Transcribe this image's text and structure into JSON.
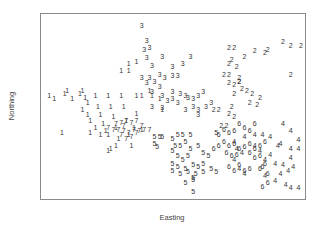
{
  "chart_data": {
    "type": "scatter",
    "title": "",
    "xlabel": "Easting",
    "ylabel": "Northing",
    "grid": false,
    "legend": null,
    "axes_ticks_shown": false,
    "marker": "cluster-number-text",
    "plot_frame_px": {
      "x0": 40,
      "y0": 13,
      "x1": 305,
      "y1": 199
    },
    "series": [
      {
        "name": "1",
        "points": [
          [
            0.02,
            0.44
          ],
          [
            0.04,
            0.46
          ],
          [
            0.08,
            0.43
          ],
          [
            0.09,
            0.41
          ],
          [
            0.11,
            0.46
          ],
          [
            0.14,
            0.43
          ],
          [
            0.15,
            0.41
          ],
          [
            0.16,
            0.45
          ],
          [
            0.17,
            0.48
          ],
          [
            0.15,
            0.52
          ],
          [
            0.17,
            0.55
          ],
          [
            0.18,
            0.58
          ],
          [
            0.2,
            0.44
          ],
          [
            0.21,
            0.5
          ],
          [
            0.22,
            0.55
          ],
          [
            0.23,
            0.6
          ],
          [
            0.24,
            0.64
          ],
          [
            0.25,
            0.44
          ],
          [
            0.26,
            0.5
          ],
          [
            0.27,
            0.56
          ],
          [
            0.28,
            0.62
          ],
          [
            0.29,
            0.68
          ],
          [
            0.3,
            0.44
          ],
          [
            0.31,
            0.5
          ],
          [
            0.32,
            0.58
          ],
          [
            0.33,
            0.66
          ],
          [
            0.34,
            0.72
          ],
          [
            0.36,
            0.44
          ],
          [
            0.38,
            0.44
          ],
          [
            0.41,
            0.41
          ],
          [
            0.42,
            0.44
          ],
          [
            0.45,
            0.46
          ],
          [
            0.46,
            0.52
          ],
          [
            0.36,
            0.54
          ],
          [
            0.35,
            0.62
          ],
          [
            0.38,
            0.63
          ],
          [
            0.2,
            0.62
          ],
          [
            0.22,
            0.66
          ],
          [
            0.25,
            0.66
          ],
          [
            0.28,
            0.72
          ],
          [
            0.3,
            0.3
          ],
          [
            0.33,
            0.3
          ],
          [
            0.36,
            0.25
          ],
          [
            0.33,
            0.26
          ],
          [
            0.07,
            0.65
          ],
          [
            0.18,
            0.65
          ],
          [
            0.25,
            0.75
          ],
          [
            0.26,
            0.74
          ]
        ]
      },
      {
        "name": "2",
        "points": [
          [
            0.72,
            0.17
          ],
          [
            0.74,
            0.17
          ],
          [
            0.78,
            0.22
          ],
          [
            0.82,
            0.19
          ],
          [
            0.86,
            0.2
          ],
          [
            0.87,
            0.18
          ],
          [
            0.93,
            0.14
          ],
          [
            0.96,
            0.16
          ],
          [
            1.0,
            0.16
          ],
          [
            0.72,
            0.26
          ],
          [
            0.73,
            0.24
          ],
          [
            0.75,
            0.28
          ],
          [
            0.7,
            0.32
          ],
          [
            0.72,
            0.32
          ],
          [
            0.76,
            0.34
          ],
          [
            0.72,
            0.37
          ],
          [
            0.74,
            0.38
          ],
          [
            0.76,
            0.36
          ],
          [
            0.77,
            0.4
          ],
          [
            0.79,
            0.41
          ],
          [
            0.81,
            0.43
          ],
          [
            0.74,
            0.43
          ],
          [
            0.8,
            0.48
          ],
          [
            0.84,
            0.45
          ],
          [
            0.83,
            0.49
          ],
          [
            0.73,
            0.5
          ],
          [
            0.72,
            0.54
          ],
          [
            0.74,
            0.56
          ],
          [
            0.96,
            0.32
          ],
          [
            0.66,
            0.52
          ],
          [
            0.68,
            0.52
          ],
          [
            0.69,
            0.61
          ],
          [
            0.71,
            0.61
          ],
          [
            0.76,
            0.36
          ]
        ]
      },
      {
        "name": "3",
        "points": [
          [
            0.38,
            0.05
          ],
          [
            0.4,
            0.13
          ],
          [
            0.41,
            0.17
          ],
          [
            0.39,
            0.18
          ],
          [
            0.4,
            0.23
          ],
          [
            0.42,
            0.27
          ],
          [
            0.46,
            0.22
          ],
          [
            0.5,
            0.28
          ],
          [
            0.54,
            0.26
          ],
          [
            0.57,
            0.22
          ],
          [
            0.38,
            0.34
          ],
          [
            0.41,
            0.34
          ],
          [
            0.43,
            0.36
          ],
          [
            0.45,
            0.32
          ],
          [
            0.47,
            0.34
          ],
          [
            0.5,
            0.33
          ],
          [
            0.52,
            0.33
          ],
          [
            0.4,
            0.37
          ],
          [
            0.45,
            0.39
          ],
          [
            0.42,
            0.42
          ],
          [
            0.46,
            0.44
          ],
          [
            0.5,
            0.42
          ],
          [
            0.53,
            0.43
          ],
          [
            0.55,
            0.44
          ],
          [
            0.5,
            0.46
          ],
          [
            0.48,
            0.47
          ],
          [
            0.42,
            0.5
          ],
          [
            0.46,
            0.51
          ],
          [
            0.52,
            0.48
          ],
          [
            0.56,
            0.45
          ],
          [
            0.6,
            0.44
          ],
          [
            0.62,
            0.42
          ],
          [
            0.58,
            0.46
          ],
          [
            0.55,
            0.52
          ],
          [
            0.6,
            0.52
          ],
          [
            0.63,
            0.5
          ],
          [
            0.65,
            0.48
          ],
          [
            0.6,
            0.55
          ],
          [
            0.58,
            0.5
          ]
        ]
      },
      {
        "name": "4",
        "points": [
          [
            0.74,
            0.7
          ],
          [
            0.78,
            0.67
          ],
          [
            0.82,
            0.66
          ],
          [
            0.85,
            0.66
          ],
          [
            0.88,
            0.67
          ],
          [
            0.93,
            0.6
          ],
          [
            0.96,
            0.64
          ],
          [
            0.99,
            0.69
          ],
          [
            0.92,
            0.71
          ],
          [
            0.96,
            0.74
          ],
          [
            0.99,
            0.74
          ],
          [
            0.82,
            0.72
          ],
          [
            0.84,
            0.75
          ],
          [
            0.88,
            0.77
          ],
          [
            0.86,
            0.8
          ],
          [
            0.9,
            0.82
          ],
          [
            0.93,
            0.83
          ],
          [
            0.96,
            0.79
          ],
          [
            0.97,
            0.84
          ],
          [
            0.92,
            0.88
          ],
          [
            0.95,
            0.86
          ],
          [
            0.9,
            0.92
          ],
          [
            0.94,
            0.94
          ],
          [
            0.96,
            0.96
          ],
          [
            0.99,
            0.96
          ],
          [
            0.86,
            0.89
          ],
          [
            0.91,
            0.72
          ],
          [
            0.75,
            0.74
          ],
          [
            0.77,
            0.76
          ],
          [
            0.74,
            0.8
          ],
          [
            0.76,
            0.85
          ],
          [
            0.78,
            0.88
          ]
        ]
      },
      {
        "name": "5",
        "points": [
          [
            0.5,
            0.68
          ],
          [
            0.52,
            0.66
          ],
          [
            0.54,
            0.66
          ],
          [
            0.51,
            0.72
          ],
          [
            0.53,
            0.72
          ],
          [
            0.55,
            0.7
          ],
          [
            0.5,
            0.75
          ],
          [
            0.52,
            0.78
          ],
          [
            0.54,
            0.8
          ],
          [
            0.56,
            0.78
          ],
          [
            0.5,
            0.82
          ],
          [
            0.52,
            0.84
          ],
          [
            0.55,
            0.85
          ],
          [
            0.58,
            0.83
          ],
          [
            0.6,
            0.84
          ],
          [
            0.62,
            0.82
          ],
          [
            0.57,
            0.74
          ],
          [
            0.6,
            0.72
          ],
          [
            0.62,
            0.76
          ],
          [
            0.64,
            0.78
          ],
          [
            0.5,
            0.86
          ],
          [
            0.53,
            0.88
          ],
          [
            0.56,
            0.87
          ],
          [
            0.59,
            0.88
          ],
          [
            0.62,
            0.87
          ],
          [
            0.65,
            0.85
          ],
          [
            0.67,
            0.87
          ],
          [
            0.58,
            0.91
          ],
          [
            0.55,
            0.93
          ],
          [
            0.58,
            0.98
          ],
          [
            0.58,
            0.9
          ],
          [
            0.43,
            0.67
          ],
          [
            0.45,
            0.67
          ],
          [
            0.46,
            0.67
          ],
          [
            0.43,
            0.71
          ],
          [
            0.44,
            0.73
          ],
          [
            0.57,
            0.66
          ],
          [
            0.67,
            0.65
          ]
        ]
      },
      {
        "name": "6",
        "points": [
          [
            0.68,
            0.66
          ],
          [
            0.7,
            0.63
          ],
          [
            0.72,
            0.65
          ],
          [
            0.74,
            0.64
          ],
          [
            0.76,
            0.6
          ],
          [
            0.78,
            0.62
          ],
          [
            0.8,
            0.64
          ],
          [
            0.82,
            0.6
          ],
          [
            0.7,
            0.7
          ],
          [
            0.72,
            0.72
          ],
          [
            0.74,
            0.71
          ],
          [
            0.76,
            0.74
          ],
          [
            0.78,
            0.73
          ],
          [
            0.8,
            0.71
          ],
          [
            0.82,
            0.74
          ],
          [
            0.84,
            0.72
          ],
          [
            0.86,
            0.7
          ],
          [
            0.71,
            0.76
          ],
          [
            0.73,
            0.78
          ],
          [
            0.75,
            0.77
          ],
          [
            0.8,
            0.76
          ],
          [
            0.82,
            0.79
          ],
          [
            0.84,
            0.78
          ],
          [
            0.76,
            0.83
          ],
          [
            0.78,
            0.86
          ],
          [
            0.8,
            0.85
          ],
          [
            0.84,
            0.85
          ],
          [
            0.85,
            0.84
          ],
          [
            0.86,
            0.82
          ],
          [
            0.87,
            0.88
          ],
          [
            0.87,
            0.93
          ],
          [
            0.85,
            0.95
          ],
          [
            0.66,
            0.74
          ],
          [
            0.68,
            0.72
          ],
          [
            0.72,
            0.84
          ],
          [
            0.74,
            0.86
          ]
        ]
      },
      {
        "name": "7",
        "points": [
          [
            0.28,
            0.6
          ],
          [
            0.3,
            0.59
          ],
          [
            0.32,
            0.58
          ],
          [
            0.34,
            0.59
          ],
          [
            0.36,
            0.58
          ],
          [
            0.29,
            0.63
          ],
          [
            0.31,
            0.64
          ],
          [
            0.33,
            0.65
          ],
          [
            0.35,
            0.63
          ],
          [
            0.37,
            0.64
          ],
          [
            0.39,
            0.63
          ],
          [
            0.41,
            0.63
          ],
          [
            0.3,
            0.66
          ],
          [
            0.32,
            0.68
          ],
          [
            0.34,
            0.67
          ],
          [
            0.36,
            0.65
          ],
          [
            0.25,
            0.62
          ],
          [
            0.27,
            0.63
          ],
          [
            0.38,
            0.61
          ],
          [
            0.31,
            0.61
          ]
        ]
      }
    ]
  }
}
